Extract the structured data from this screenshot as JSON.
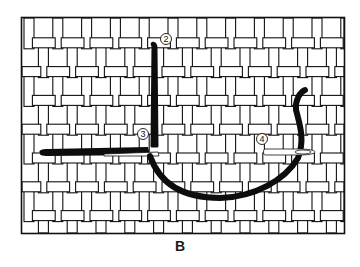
{
  "figure": {
    "caption": "B",
    "markers": [
      {
        "label": "2",
        "name": "step-2"
      },
      {
        "label": "3",
        "name": "step-3"
      },
      {
        "label": "4",
        "name": "step-4"
      }
    ],
    "colors": {
      "ink": "#111111",
      "canvas": "#ffffff",
      "thread": "#0d0d0d"
    }
  }
}
